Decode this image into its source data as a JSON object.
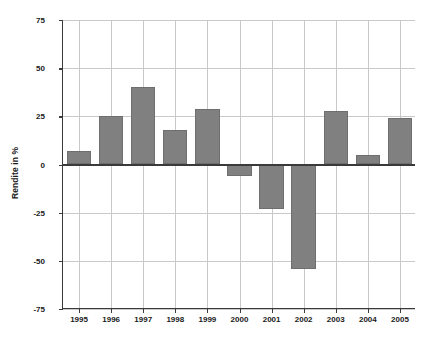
{
  "chart_data": {
    "type": "bar",
    "title": "",
    "subtitle": "",
    "xlabel": "",
    "ylabel": "Rendite in %",
    "categories": [
      "1995",
      "1996",
      "1997",
      "1998",
      "1999",
      "2000",
      "2001",
      "2002",
      "2003",
      "2004",
      "2005"
    ],
    "values": [
      7,
      25,
      40,
      18,
      29,
      -6,
      -23,
      -54,
      28,
      5,
      24
    ],
    "ylim": [
      -75,
      75
    ],
    "yticks": [
      75,
      50,
      25,
      0,
      -25,
      -50,
      -75
    ],
    "ytick_labels": [
      "75",
      "50",
      "25",
      "0",
      "-25",
      "-50",
      "-75"
    ],
    "grid": true,
    "grid_axis": "both",
    "legend": false,
    "legend_position": "none",
    "series": [
      {
        "name": "Rendite",
        "values": [
          7,
          25,
          40,
          18,
          29,
          -6,
          -23,
          -54,
          28,
          5,
          24
        ],
        "color": "#808080"
      }
    ]
  },
  "colors": {
    "bar_fill": "#808080",
    "bar_stroke": "#6e6e6e",
    "gridline": "#c9c9c9",
    "axis": "#3a3a3a",
    "text": "#1a1a1a",
    "background": "#ffffff"
  }
}
